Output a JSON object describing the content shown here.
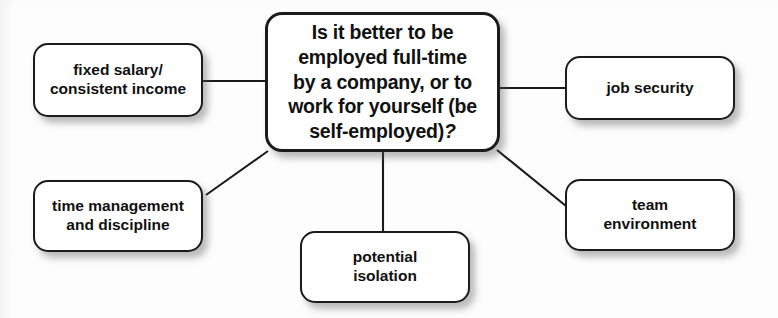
{
  "diagram": {
    "type": "mind-map",
    "background_color": "#fdfdfd",
    "node_fill_color": "#ffffff",
    "node_border_color": "#1b1b1b",
    "connector_color": "#1b1b1b",
    "central": {
      "id": "central-question",
      "line1": "Is it better to be",
      "line2": "employed full-time",
      "line3": "by a company, or to",
      "line4": "work for yourself (be",
      "line5": "self-employed)",
      "question_mark": "?"
    },
    "branches": [
      {
        "id": "fixed-salary",
        "line1": "fixed salary/",
        "line2": "consistent income",
        "connector": "horizontal"
      },
      {
        "id": "job-security",
        "line1": "job security",
        "line2": "",
        "connector": "horizontal"
      },
      {
        "id": "time-management",
        "line1": "time management",
        "line2": "and discipline",
        "connector": "diagonal"
      },
      {
        "id": "team-environment",
        "line1": "team",
        "line2": "environment",
        "connector": "diagonal"
      },
      {
        "id": "potential-isolation",
        "line1": "potential",
        "line2": "isolation",
        "connector": "vertical"
      }
    ]
  }
}
